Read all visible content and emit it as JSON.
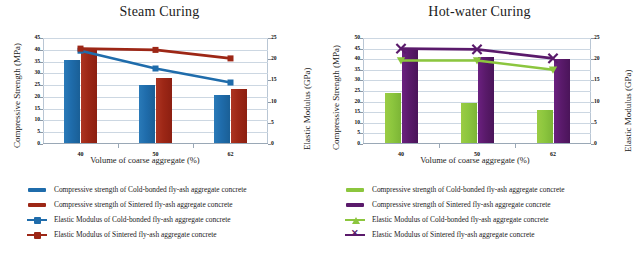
{
  "figure": {
    "xlabel": "Volume of coarse aggregate (%)",
    "ylabel_left": "Compressive Strength (MPa)",
    "ylabel_right": "Elastic Modulus (GPa)",
    "categories": [
      "40",
      "50",
      "62"
    ]
  },
  "colors": {
    "steam_bar_coldbonded": "#1f6cab",
    "steam_bar_sintered": "#9d2716",
    "steam_line_coldbonded": "#1f6cab",
    "steam_line_sintered": "#9d2716",
    "hot_bar_coldbonded": "#8cc63e",
    "hot_bar_sintered": "#5a1a6b",
    "hot_line_coldbonded": "#8cc63e",
    "hot_line_sintered": "#5a1a6b",
    "gridline": "#ccd7e2",
    "axis": "#9aa8b6"
  },
  "legend_labels": {
    "cs_cold": "Compressive strength of Cold-bonded fly-ash aggregate concrete",
    "cs_sint": "Compressive strength of Sintered fly-ash aggregate concrete",
    "em_cold": "Elastic Modulus of Cold-bonded fly-ash aggregate concrete",
    "em_sint": "Elastic Modulus of Sintered fly-ash aggregate concrete"
  },
  "chart_data": [
    {
      "type": "bar",
      "title": "Steam Curing",
      "xlabel": "Volume of coarse aggregate (%)",
      "ylabel": "Compressive Strength (MPa)",
      "y2label": "Elastic Modulus (GPa)",
      "categories": [
        "40",
        "50",
        "62"
      ],
      "ylim": [
        0,
        45
      ],
      "y2lim": [
        0,
        25
      ],
      "yticks": [
        0,
        5,
        10,
        15,
        20,
        25,
        30,
        35,
        40,
        45
      ],
      "y2ticks": [
        0,
        5,
        10,
        15,
        20,
        25
      ],
      "grid": true,
      "legend_position": "below",
      "series": [
        {
          "name": "Compressive strength of Cold-bonded fly-ash aggregate concrete",
          "kind": "bar",
          "axis": "left",
          "color": "#1f6cab",
          "values": [
            35.5,
            25.0,
            21.0
          ]
        },
        {
          "name": "Compressive strength of Sintered fly-ash aggregate concrete",
          "kind": "bar",
          "axis": "left",
          "color": "#9d2716",
          "values": [
            40.5,
            28.0,
            23.3
          ]
        },
        {
          "name": "Elastic Modulus of Cold-bonded fly-ash aggregate concrete",
          "kind": "line",
          "axis": "right",
          "color": "#1f6cab",
          "marker": "square",
          "values": [
            22.0,
            17.8,
            14.5
          ]
        },
        {
          "name": "Elastic Modulus of Sintered fly-ash aggregate concrete",
          "kind": "line",
          "axis": "right",
          "color": "#9d2716",
          "marker": "square",
          "values": [
            22.5,
            22.2,
            20.2
          ]
        }
      ]
    },
    {
      "type": "bar",
      "title": "Hot-water Curing",
      "xlabel": "Volume of coarse aggregate (%)",
      "ylabel": "Compressive Strength (MPa)",
      "y2label": "Elastic Modulus (GPa)",
      "categories": [
        "40",
        "50",
        "62"
      ],
      "ylim": [
        0,
        50
      ],
      "y2lim": [
        0,
        25
      ],
      "yticks": [
        0,
        5,
        10,
        15,
        20,
        25,
        30,
        35,
        40,
        45,
        50
      ],
      "y2ticks": [
        0,
        5,
        10,
        15,
        20,
        25
      ],
      "grid": true,
      "legend_position": "below",
      "series": [
        {
          "name": "Compressive strength of Cold-bonded fly-ash aggregate concrete",
          "kind": "bar",
          "axis": "left",
          "color": "#8cc63e",
          "values": [
            24.0,
            19.5,
            16.0
          ]
        },
        {
          "name": "Compressive strength of Sintered fly-ash aggregate concrete",
          "kind": "bar",
          "axis": "left",
          "color": "#5a1a6b",
          "values": [
            44.5,
            41.0,
            40.0
          ]
        },
        {
          "name": "Elastic Modulus of Cold-bonded fly-ash aggregate concrete",
          "kind": "line",
          "axis": "right",
          "color": "#8cc63e",
          "marker": "triangle",
          "values": [
            19.7,
            19.7,
            17.5
          ]
        },
        {
          "name": "Elastic Modulus of Sintered fly-ash aggregate concrete",
          "kind": "line",
          "axis": "right",
          "color": "#5a1a6b",
          "marker": "x",
          "values": [
            22.5,
            22.3,
            20.2
          ]
        }
      ]
    }
  ]
}
